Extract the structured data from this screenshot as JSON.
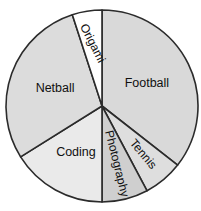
{
  "chart_data": {
    "type": "pie",
    "title": "",
    "subtitle": "",
    "xlabel": "",
    "ylabel": "",
    "grid": false,
    "legend": "none",
    "labels_position": "inside-slices",
    "total_degrees": 360,
    "center_px": [
      102,
      106
    ],
    "radius_px": 96,
    "start_angle_deg": 0,
    "direction": "clockwise",
    "categories": [
      "Football",
      "Tennis",
      "Photography",
      "Coding",
      "Netball",
      "Origami"
    ],
    "angles_deg": [
      128,
      24,
      28,
      58,
      104,
      18
    ],
    "values_percent": [
      35.6,
      6.7,
      7.8,
      16.1,
      28.9,
      5.0
    ],
    "slices": [
      {
        "label": "Football",
        "start_deg": 0,
        "end_deg": 128,
        "angle_deg": 128,
        "percent": 35.6,
        "fill": "#d9d9d9",
        "label_rotation_deg": 0,
        "label_radius_frac": 0.52
      },
      {
        "label": "Tennis",
        "start_deg": 128,
        "end_deg": 152,
        "angle_deg": 24,
        "percent": 6.7,
        "fill": "#dedede",
        "label_rotation_deg": 50,
        "label_radius_frac": 0.66
      },
      {
        "label": "Photography",
        "start_deg": 152,
        "end_deg": 180,
        "angle_deg": 28,
        "percent": 7.8,
        "fill": "#cfcfcf",
        "label_rotation_deg": 76,
        "label_radius_frac": 0.62
      },
      {
        "label": "Coding",
        "start_deg": 180,
        "end_deg": 238,
        "angle_deg": 58,
        "percent": 16.1,
        "fill": "#eaeaea",
        "label_rotation_deg": 0,
        "label_radius_frac": 0.56
      },
      {
        "label": "Netball",
        "start_deg": 238,
        "end_deg": 342,
        "angle_deg": 104,
        "percent": 28.9,
        "fill": "#dcdcdc",
        "label_rotation_deg": 0,
        "label_radius_frac": 0.52
      },
      {
        "label": "Origami",
        "start_deg": 342,
        "end_deg": 360,
        "angle_deg": 18,
        "percent": 5.0,
        "fill": "#ffffff",
        "label_rotation_deg": 63,
        "label_radius_frac": 0.66
      }
    ],
    "style": {
      "background": "#ffffff",
      "stroke": "#2b2b2b",
      "stroke_width_px": 1.6,
      "label_color": "#101010"
    }
  }
}
